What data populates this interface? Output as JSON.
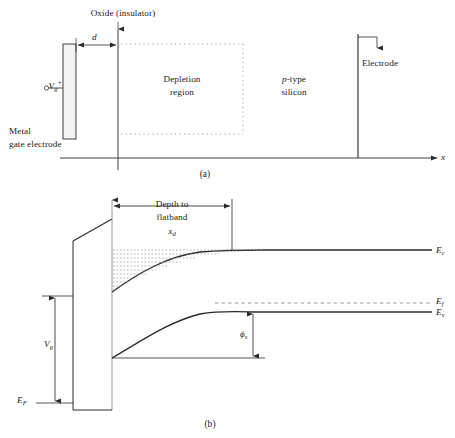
{
  "figure": {
    "panel_a": {
      "caption": "(a)",
      "oxide_label": "Oxide (insulator)",
      "thickness_label": "d",
      "gate_voltage": {
        "base": "V",
        "sub": "g",
        "sup": "+"
      },
      "metal_label_line1": "Metal",
      "metal_label_line2": "gate electrode",
      "depletion_line1": "Depletion",
      "depletion_line2": "region",
      "substrate_line1_italic": "p",
      "substrate_line1_rest": "-type",
      "substrate_line2": "silicon",
      "electrode_label": "Electrode",
      "axis_label": "x"
    },
    "panel_b": {
      "caption": "(b)",
      "depth_line1": "Depth to",
      "depth_line2": "flatband",
      "depth_symbol": {
        "base": "x",
        "sub": "d"
      },
      "level_ec": {
        "base": "E",
        "sub": "c"
      },
      "level_ef_bulk": {
        "base": "E",
        "sub": "f"
      },
      "level_ev": {
        "base": "E",
        "sub": "v"
      },
      "level_ef_metal": {
        "base": "E",
        "sub": "F"
      },
      "gate_voltage": {
        "base": "V",
        "sub": "g"
      },
      "surface_potential": {
        "base": "ϕ",
        "sub": "s"
      }
    },
    "colors": {
      "line": "#2b2b2b",
      "dotted": "#8a8a8a",
      "hatch": "#9a9a9a",
      "background": "#ffffff",
      "text": "#1a1a1a"
    }
  }
}
